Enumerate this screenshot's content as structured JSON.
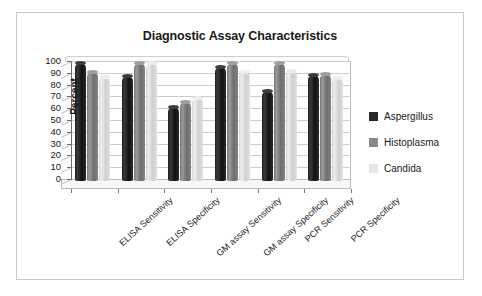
{
  "frame": {
    "border_color": "#c9c9c9",
    "background": "#ffffff"
  },
  "chart_data": {
    "type": "bar",
    "title": "Diagnostic Assay Characteristics",
    "xlabel": "",
    "ylabel": "Percent",
    "ylim": [
      0,
      100
    ],
    "ytick_step": 10,
    "yticks": [
      100,
      90,
      80,
      70,
      60,
      50,
      40,
      30,
      20,
      10,
      0
    ],
    "grid": true,
    "legend_position": "right",
    "three_d": true,
    "categories": [
      "ELISA Sensitivity",
      "ELISA Specificity",
      "GM assay Sensitivity",
      "GM assay Specificity",
      "PCR Sensitivity",
      "PCR Specificity"
    ],
    "series": [
      {
        "name": "Aspergillus",
        "color": "#262626",
        "values": [
          100,
          89,
          63,
          97,
          76,
          90
        ]
      },
      {
        "name": "Histoplasma",
        "color": "#8a8a8a",
        "values": [
          92,
          100,
          67,
          100,
          100,
          91
        ]
      },
      {
        "name": "Candida",
        "color": "#e6e6e6",
        "values": [
          88,
          100,
          70,
          92,
          93,
          87
        ]
      }
    ]
  }
}
